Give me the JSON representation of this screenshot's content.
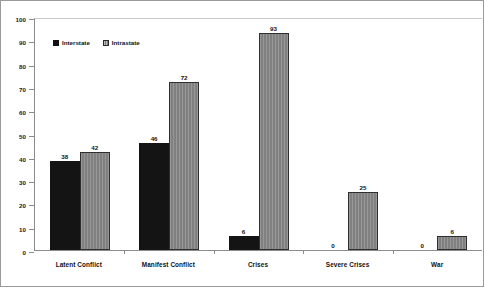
{
  "chart_data": {
    "type": "bar",
    "title": "",
    "subtitle": "",
    "xlabel": "",
    "ylabel": "",
    "ylim": [
      0,
      100
    ],
    "ytick_step": 10,
    "yticks": [
      "0",
      "10",
      "20",
      "30",
      "40",
      "50",
      "60",
      "70",
      "80",
      "90",
      "100"
    ],
    "grid": false,
    "legend_position": "top-left",
    "categories": [
      "Latent Conflict",
      "Manifest Conflict",
      "Crises",
      "Severe Crises",
      "War"
    ],
    "series": [
      {
        "name": "Interstate",
        "color": "#141414",
        "values": [
          38,
          46,
          6,
          0,
          0
        ],
        "labels": [
          "38",
          "46",
          "6",
          "0",
          "0"
        ]
      },
      {
        "name": "Intrastate",
        "color": "#808080",
        "values": [
          42,
          72,
          93,
          25,
          6
        ],
        "labels": [
          "42",
          "72",
          "93",
          "25",
          "6"
        ]
      }
    ]
  },
  "legend": {
    "items": [
      {
        "label": "Interstate",
        "swatch": "black-square-icon"
      },
      {
        "label": "Intrastate",
        "swatch": "gray-square-icon"
      }
    ]
  },
  "colors": {
    "interstate": "#141414",
    "intrastate": "#808080",
    "axis": "#8c8c8c",
    "frame": "#9a9a9a",
    "text": "#111111",
    "background": "#ffffff"
  }
}
